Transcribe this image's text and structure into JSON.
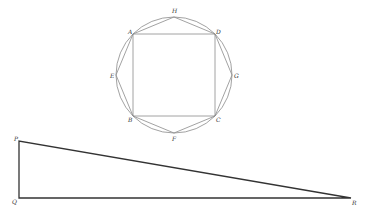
{
  "figure": {
    "colors": {
      "background": "#ffffff",
      "thin_line": "#8a8a8a",
      "thick_line": "#333333",
      "label": "#333333"
    },
    "circle": {
      "cx": 174,
      "cy": 75,
      "r": 58
    },
    "octagon_points": {
      "H": {
        "label": "H",
        "x": 174,
        "y": 17
      },
      "D": {
        "label": "D",
        "x": 215,
        "y": 34
      },
      "G": {
        "label": "G",
        "x": 232,
        "y": 75
      },
      "C": {
        "label": "C",
        "x": 215,
        "y": 116
      },
      "F": {
        "label": "F",
        "x": 174,
        "y": 133
      },
      "B": {
        "label": "B",
        "x": 133,
        "y": 116
      },
      "E": {
        "label": "E",
        "x": 116,
        "y": 75
      },
      "A": {
        "label": "A",
        "x": 133,
        "y": 34
      }
    },
    "square": [
      "A",
      "D",
      "C",
      "B"
    ],
    "triangle": {
      "P": {
        "label": "P",
        "x": 19,
        "y": 141
      },
      "Q": {
        "label": "Q",
        "x": 19,
        "y": 198
      },
      "R": {
        "label": "R",
        "x": 351,
        "y": 198
      }
    }
  }
}
